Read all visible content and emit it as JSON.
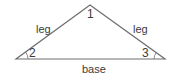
{
  "diagram": {
    "stroke_color": "#6e6e6e",
    "text_color": "#3a3a3a",
    "vertices": {
      "apex": [
        90,
        5
      ],
      "left": [
        16,
        59
      ],
      "right": [
        165,
        59
      ]
    },
    "labels": {
      "left_side": "leg",
      "right_side": "leg",
      "base": "base",
      "angle_apex": "1",
      "angle_left": "2",
      "angle_right": "3"
    }
  }
}
